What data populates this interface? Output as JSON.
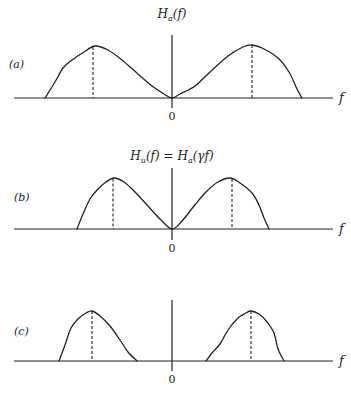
{
  "figure": {
    "panels": [
      {
        "id": "a",
        "label": "(a)",
        "title": "H_a(f)",
        "title_main": "H",
        "title_sub": "a",
        "title_rest": "(f)",
        "x_axis_label": "f",
        "origin_label": "0",
        "baseline_y": 98,
        "axis_top_y": 35,
        "axis_bottom_y": 108,
        "axis_left_x": 14,
        "axis_right_x": 333,
        "origin_x": 172,
        "label_pos": [
          9,
          68
        ],
        "title_pos": [
          172,
          18
        ],
        "curve": [
          [
            45,
            98
          ],
          [
            55,
            82
          ],
          [
            63,
            68
          ],
          [
            72,
            60
          ],
          [
            84,
            52
          ],
          [
            95,
            46
          ],
          [
            108,
            50
          ],
          [
            122,
            60
          ],
          [
            138,
            74
          ],
          [
            152,
            86
          ],
          [
            164,
            94
          ],
          [
            172,
            98
          ],
          [
            180,
            94
          ],
          [
            195,
            86
          ],
          [
            210,
            72
          ],
          [
            228,
            56
          ],
          [
            243,
            47
          ],
          [
            252,
            45
          ],
          [
            264,
            49
          ],
          [
            278,
            58
          ],
          [
            289,
            72
          ],
          [
            297,
            89
          ],
          [
            302,
            98
          ]
        ],
        "peaks_x": [
          93,
          252
        ],
        "peak_y": 46
      },
      {
        "id": "b",
        "label": "(b)",
        "title": "H_u(f) = H_a(γf)",
        "title_main": "H",
        "title_sub": "u",
        "title_rest": "(f) = ",
        "title_main2": "H",
        "title_sub2": "a",
        "title_rest2": "(γf)",
        "x_axis_label": "f",
        "origin_label": "0",
        "baseline_y": 229,
        "axis_top_y": 168,
        "axis_bottom_y": 240,
        "axis_left_x": 14,
        "axis_right_x": 333,
        "origin_x": 172,
        "label_pos": [
          14,
          201
        ],
        "title_pos": [
          172,
          160
        ],
        "curve": [
          [
            77,
            229
          ],
          [
            83,
            214
          ],
          [
            90,
            199
          ],
          [
            98,
            189
          ],
          [
            106,
            182
          ],
          [
            114,
            178
          ],
          [
            124,
            182
          ],
          [
            135,
            192
          ],
          [
            148,
            206
          ],
          [
            160,
            219
          ],
          [
            172,
            229
          ],
          [
            182,
            221
          ],
          [
            194,
            206
          ],
          [
            206,
            192
          ],
          [
            218,
            182
          ],
          [
            230,
            178
          ],
          [
            240,
            183
          ],
          [
            252,
            193
          ],
          [
            259,
            205
          ],
          [
            264,
            218
          ],
          [
            269,
            229
          ]
        ],
        "peaks_x": [
          113,
          232
        ],
        "peak_y": 178
      },
      {
        "id": "c",
        "label": "(c)",
        "title": "",
        "x_axis_label": "f",
        "origin_label": "0",
        "baseline_y": 361,
        "axis_top_y": 300,
        "axis_bottom_y": 371,
        "axis_left_x": 14,
        "axis_right_x": 333,
        "origin_x": 172,
        "label_pos": [
          14,
          335
        ],
        "title_pos": [
          172,
          290
        ],
        "curve_left": [
          [
            59,
            361
          ],
          [
            65,
            345
          ],
          [
            71,
            328
          ],
          [
            79,
            318
          ],
          [
            86,
            313
          ],
          [
            92,
            311
          ],
          [
            100,
            316
          ],
          [
            110,
            326
          ],
          [
            120,
            340
          ],
          [
            128,
            352
          ],
          [
            137,
            361
          ]
        ],
        "curve_right": [
          [
            206,
            361
          ],
          [
            212,
            353
          ],
          [
            220,
            344
          ],
          [
            228,
            330
          ],
          [
            238,
            318
          ],
          [
            246,
            313
          ],
          [
            251,
            311
          ],
          [
            259,
            314
          ],
          [
            267,
            322
          ],
          [
            274,
            333
          ],
          [
            278,
            349
          ],
          [
            284,
            361
          ]
        ],
        "peaks_x": [
          92,
          251
        ],
        "peak_y": 311
      }
    ]
  },
  "chart_data": [
    {
      "type": "line",
      "title": "H_a(f)",
      "panel_label": "(a)",
      "xlabel": "f",
      "ylabel": "",
      "x_ticks": [
        "0"
      ],
      "description": "Symmetric magnitude spectrum with two broad lobes, zero at f=0, peaks marked by dashed vertical lines",
      "x": [
        -1.0,
        -0.85,
        -0.7,
        -0.5,
        -0.3,
        -0.15,
        0,
        0.15,
        0.3,
        0.5,
        0.7,
        0.85,
        1.0
      ],
      "values": [
        0,
        0.55,
        0.88,
        1.0,
        0.72,
        0.3,
        0,
        0.3,
        0.72,
        1.0,
        0.88,
        0.55,
        0
      ],
      "peak_markers_x": [
        -0.5,
        0.5
      ],
      "grid": false
    },
    {
      "type": "line",
      "title": "H_u(f) = H_a(γf)",
      "panel_label": "(b)",
      "xlabel": "f",
      "ylabel": "",
      "x_ticks": [
        "0"
      ],
      "description": "Frequency-compressed version of (a), narrower lobes, zero at f=0",
      "x": [
        -0.6,
        -0.5,
        -0.4,
        -0.3,
        -0.2,
        -0.1,
        0,
        0.1,
        0.2,
        0.3,
        0.4,
        0.5,
        0.6
      ],
      "values": [
        0,
        0.55,
        0.88,
        1.0,
        0.72,
        0.3,
        0,
        0.3,
        0.72,
        1.0,
        0.88,
        0.55,
        0
      ],
      "peak_markers_x": [
        -0.37,
        0.37
      ],
      "grid": false
    },
    {
      "type": "line",
      "title": "",
      "panel_label": "(c)",
      "xlabel": "f",
      "ylabel": "",
      "x_ticks": [
        "0"
      ],
      "description": "Two separated bandpass bumps, zero around f=0",
      "x": [
        -0.72,
        -0.6,
        -0.5,
        -0.4,
        -0.22,
        0,
        0.22,
        0.35,
        0.5,
        0.6,
        0.71
      ],
      "values": [
        0,
        0.7,
        1.0,
        0.6,
        0,
        0,
        0,
        0.65,
        1.0,
        0.6,
        0
      ],
      "peak_markers_x": [
        -0.5,
        0.5
      ],
      "grid": false
    }
  ]
}
